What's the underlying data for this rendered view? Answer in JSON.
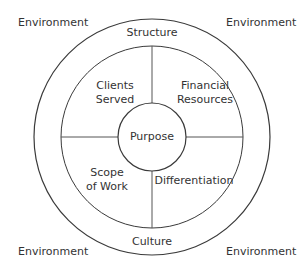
{
  "diagram": {
    "colors": {
      "stroke": "#3a3a3a",
      "text": "#333333",
      "background": "#ffffff"
    },
    "corners": [
      {
        "label": "Environment",
        "position": "top-left"
      },
      {
        "label": "Environment",
        "position": "top-right"
      },
      {
        "label": "Environment",
        "position": "bottom-left"
      },
      {
        "label": "Environment",
        "position": "bottom-right"
      }
    ],
    "ring": {
      "top": "Structure",
      "bottom": "Culture"
    },
    "quadrants": [
      {
        "label_line1": "Clients",
        "label_line2": "Served",
        "position": "top-left"
      },
      {
        "label_line1": "Financial",
        "label_line2": "Resources",
        "position": "top-right"
      },
      {
        "label_line1": "Scope",
        "label_line2": "of Work",
        "position": "bottom-left"
      },
      {
        "label_line1": "Differentiation",
        "label_line2": "",
        "position": "bottom-right"
      }
    ],
    "center": {
      "label": "Purpose"
    }
  }
}
